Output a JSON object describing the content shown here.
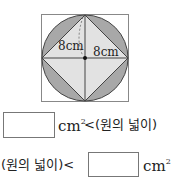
{
  "figure": {
    "labels": {
      "vertical_radius": "8cm",
      "horizontal_radius": "8cm"
    },
    "colors": {
      "circle_fill": "#a8a8a8",
      "square_fill": "#e2e2e2",
      "stroke": "#444444",
      "outer_square_stroke": "#888888"
    }
  },
  "row1": {
    "unit": "cm",
    "unit_sup": "2",
    "relation": "<(원의 넓이)",
    "answer_value": ""
  },
  "row2": {
    "prefix": "(원의 넓이)<",
    "unit": "cm",
    "unit_sup": "2",
    "answer_value": ""
  }
}
